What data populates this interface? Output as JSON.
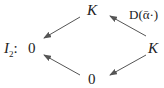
{
  "diagram": {
    "label": {
      "name": "I",
      "subscript": "2",
      "suffix": ":"
    },
    "nodes": {
      "top": "K",
      "left": "0",
      "right": "K",
      "bottom": "0"
    },
    "edges": [
      {
        "from": "right",
        "to": "top",
        "label": "D(ᾱ·)"
      },
      {
        "from": "top",
        "to": "left",
        "label": ""
      },
      {
        "from": "right",
        "to": "bottom",
        "label": ""
      },
      {
        "from": "bottom",
        "to": "left",
        "label": ""
      }
    ],
    "arrow_color": "#555555"
  }
}
